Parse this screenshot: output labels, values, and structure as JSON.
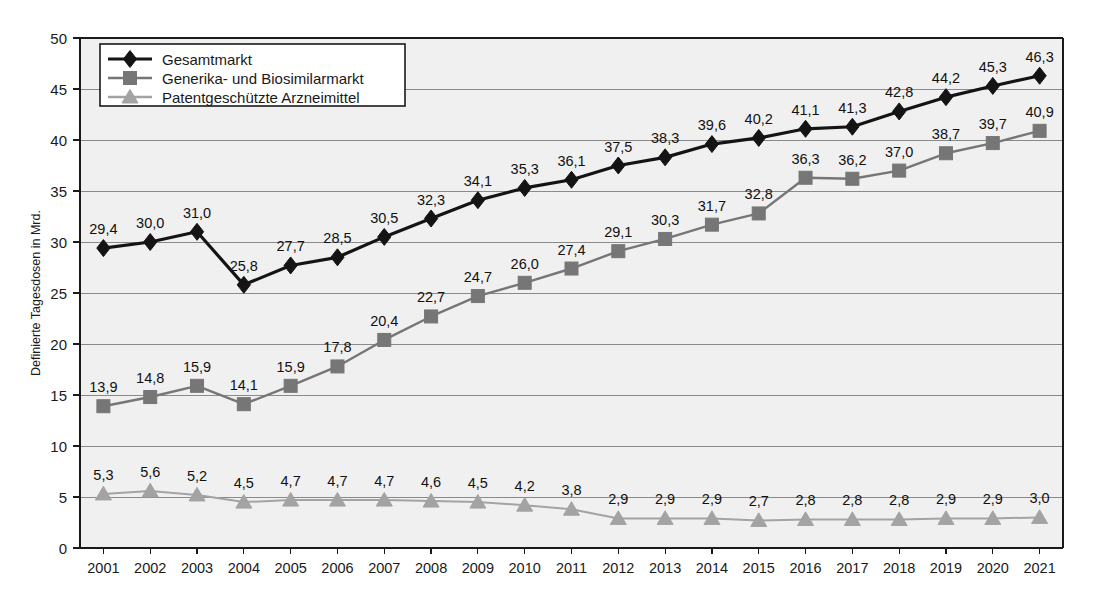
{
  "chart_data": {
    "type": "line",
    "title": "",
    "xlabel": "",
    "ylabel": "Definierte Tagesdosen in Mrd.",
    "ylim": [
      0,
      50
    ],
    "ytick_step": 5,
    "yticks": [
      "0",
      "5",
      "10",
      "15",
      "20",
      "25",
      "30",
      "35",
      "40",
      "45",
      "50"
    ],
    "grid": true,
    "legend_position": "top-left",
    "decimal_separator": ",",
    "categories": [
      "2001",
      "2002",
      "2003",
      "2004",
      "2005",
      "2006",
      "2007",
      "2008",
      "2009",
      "2010",
      "2011",
      "2012",
      "2013",
      "2014",
      "2015",
      "2016",
      "2017",
      "2018",
      "2019",
      "2020",
      "2021"
    ],
    "series": [
      {
        "name": "Gesamtmarkt",
        "marker": "diamond",
        "color": "#141414",
        "values": [
          29.4,
          30.0,
          31.0,
          25.8,
          27.7,
          28.5,
          30.5,
          32.3,
          34.1,
          35.3,
          36.1,
          37.5,
          38.3,
          39.6,
          40.2,
          41.1,
          41.3,
          42.8,
          44.2,
          45.3,
          46.3
        ],
        "labels": [
          "29,4",
          "30,0",
          "31,0",
          "25,8",
          "27,7",
          "28,5",
          "30,5",
          "32,3",
          "34,1",
          "35,3",
          "36,1",
          "37,5",
          "38,3",
          "39,6",
          "40,2",
          "41,1",
          "41,3",
          "42,8",
          "44,2",
          "45,3",
          "46,3"
        ]
      },
      {
        "name": "Generika- und Biosimilarmarkt",
        "marker": "square",
        "color": "#767676",
        "values": [
          13.9,
          14.8,
          15.9,
          14.1,
          15.9,
          17.8,
          20.4,
          22.7,
          24.7,
          26.0,
          27.4,
          29.1,
          30.3,
          31.7,
          32.8,
          36.3,
          36.2,
          37.0,
          38.7,
          39.7,
          40.9
        ],
        "labels": [
          "13,9",
          "14,8",
          "15,9",
          "14,1",
          "15,9",
          "17,8",
          "20,4",
          "22,7",
          "24,7",
          "26,0",
          "27,4",
          "29,1",
          "30,3",
          "31,7",
          "32,8",
          "36,3",
          "36,2",
          "37,0",
          "38,7",
          "39,7",
          "40,9"
        ]
      },
      {
        "name": "Patentgeschützte Arzneimittel",
        "marker": "triangle",
        "color": "#a3a3a3",
        "values": [
          5.3,
          5.6,
          5.2,
          4.5,
          4.7,
          4.7,
          4.7,
          4.6,
          4.5,
          4.2,
          3.8,
          2.9,
          2.9,
          2.9,
          2.7,
          2.8,
          2.8,
          2.8,
          2.9,
          2.9,
          3.0
        ],
        "labels": [
          "5,3",
          "5,6",
          "5,2",
          "4,5",
          "4,7",
          "4,7",
          "4,7",
          "4,6",
          "4,5",
          "4,2",
          "3,8",
          "2,9",
          "2,9",
          "2,9",
          "2,7",
          "2,8",
          "2,8",
          "2,8",
          "2,9",
          "2,9",
          "3,0"
        ]
      }
    ]
  },
  "colors": {
    "plot_background": "#f0f0f0",
    "gridline": "#8a8a8a",
    "axis": "#1a1a1a",
    "page_background": "#ffffff"
  }
}
